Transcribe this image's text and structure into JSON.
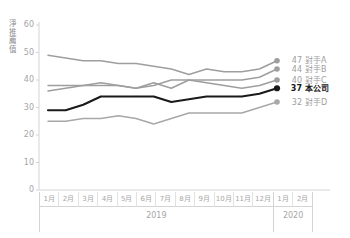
{
  "chart_data": {
    "type": "line",
    "title": "",
    "ylabel": "淨推薦值",
    "xlabel": "",
    "ylim": [
      0,
      60
    ],
    "yticks": [
      0,
      10,
      20,
      30,
      40,
      50,
      60
    ],
    "grid": false,
    "legend_position": "right",
    "x": [
      "1月",
      "2月",
      "3月",
      "4月",
      "5月",
      "6月",
      "7月",
      "8月",
      "9月",
      "10月",
      "11月",
      "12月",
      "1月",
      "2月"
    ],
    "x_groups": [
      {
        "year": "2019",
        "months": [
          "1月",
          "2月",
          "3月",
          "4月",
          "5月",
          "6月",
          "7月",
          "8月",
          "9月",
          "10月",
          "11月",
          "12月"
        ]
      },
      {
        "year": "2020",
        "months": [
          "1月",
          "2月"
        ]
      }
    ],
    "series": [
      {
        "name": "對手A",
        "end_value": 47,
        "color": "#9e9e9e",
        "highlight": false,
        "values": [
          49,
          48,
          47,
          47,
          46,
          46,
          45,
          44,
          42,
          44,
          43,
          43,
          44,
          47
        ]
      },
      {
        "name": "對手B",
        "end_value": 44,
        "color": "#9e9e9e",
        "highlight": false,
        "values": [
          38,
          38,
          38,
          39,
          38,
          37,
          38,
          40,
          40,
          40,
          40,
          40,
          41,
          44
        ]
      },
      {
        "name": "對手C",
        "end_value": 40,
        "color": "#9e9e9e",
        "highlight": false,
        "values": [
          36,
          37,
          38,
          38,
          38,
          37,
          39,
          37,
          40,
          39,
          38,
          37,
          38,
          40
        ]
      },
      {
        "name": "本公司",
        "end_value": 37,
        "color": "#1a1a1a",
        "highlight": true,
        "values": [
          29,
          29,
          31,
          34,
          34,
          34,
          34,
          32,
          33,
          34,
          34,
          34,
          35,
          37
        ]
      },
      {
        "name": "對手D",
        "end_value": 32,
        "color": "#a8a8a8",
        "highlight": false,
        "values": [
          25,
          25,
          26,
          26,
          27,
          26,
          24,
          26,
          28,
          28,
          28,
          28,
          30,
          32
        ]
      }
    ]
  }
}
